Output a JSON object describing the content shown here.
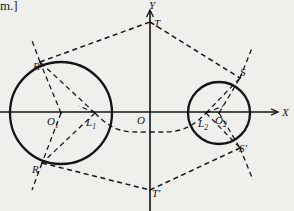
{
  "figure": {
    "cut_off_header_text": "m.]",
    "background_color": "#efefec",
    "ink_color": "#141414",
    "axes": {
      "x_label": "X",
      "y_label": "Y",
      "origin_label": "O",
      "origin_px": [
        150,
        112
      ],
      "x_axis_from": [
        0,
        112
      ],
      "x_axis_to": [
        278,
        112
      ],
      "y_axis_from": [
        150,
        10
      ],
      "y_axis_to": [
        150,
        211
      ]
    },
    "circles": [
      {
        "name": "left-circle",
        "center_label": "O",
        "center_sub": "1",
        "cx": 61,
        "cy": 113,
        "r": 51
      },
      {
        "name": "right-circle",
        "center_label": "O",
        "center_sub": "2",
        "cx": 219,
        "cy": 113,
        "r": 31
      }
    ],
    "points": [
      {
        "id": "O1",
        "label": "O",
        "sub": "1",
        "x": 61,
        "y": 113,
        "label_x": 47,
        "label_y": 125
      },
      {
        "id": "L1",
        "label": "L",
        "sub": "1",
        "x": 95,
        "y": 113,
        "label_x": 86,
        "label_y": 126
      },
      {
        "id": "O",
        "label": "O",
        "sub": "",
        "x": 150,
        "y": 112,
        "label_x": 137,
        "label_y": 124
      },
      {
        "id": "L2",
        "label": "L",
        "sub": "2",
        "x": 206,
        "y": 113,
        "label_x": 198,
        "label_y": 127
      },
      {
        "id": "O2",
        "label": "O",
        "sub": "2",
        "x": 219,
        "y": 113,
        "label_x": 215,
        "label_y": 124
      },
      {
        "id": "T",
        "label": "T",
        "sub": "",
        "x": 150,
        "y": 22,
        "label_x": 154,
        "label_y": 27
      },
      {
        "id": "Tp",
        "label": "T'",
        "sub": "",
        "x": 150,
        "y": 190,
        "label_x": 152,
        "label_y": 197
      },
      {
        "id": "R",
        "label": "R",
        "sub": "",
        "x": 40,
        "y": 62,
        "label_x": 33,
        "label_y": 70
      },
      {
        "id": "Rp",
        "label": "R'",
        "sub": "",
        "x": 42,
        "y": 163,
        "label_x": 32,
        "label_y": 173
      },
      {
        "id": "S",
        "label": "S",
        "sub": "",
        "x": 240,
        "y": 78,
        "label_x": 240,
        "label_y": 76
      },
      {
        "id": "Sp",
        "label": "S'",
        "sub": "",
        "x": 240,
        "y": 148,
        "label_x": 239,
        "label_y": 152
      }
    ],
    "tangent_lines": [
      {
        "name": "upper-tangent-R-T-S",
        "from": [
          40,
          62
        ],
        "via": [
          150,
          22
        ],
        "to": [
          240,
          78
        ]
      },
      {
        "name": "lower-tangent-Rp-Tp-Sp",
        "from": [
          42,
          163
        ],
        "via": [
          150,
          190
        ],
        "to": [
          240,
          148
        ]
      }
    ],
    "radial_dashes": [
      {
        "name": "O1-to-R",
        "from": [
          61,
          113
        ],
        "to": [
          40,
          62
        ]
      },
      {
        "name": "O1-to-Rp",
        "from": [
          61,
          113
        ],
        "to": [
          42,
          163
        ]
      },
      {
        "name": "O2-to-S",
        "from": [
          219,
          113
        ],
        "to": [
          240,
          78
        ]
      },
      {
        "name": "O2-to-Sp",
        "from": [
          219,
          113
        ],
        "to": [
          240,
          148
        ]
      },
      {
        "name": "L1-to-R",
        "from": [
          95,
          113
        ],
        "to": [
          40,
          62
        ]
      },
      {
        "name": "L1-to-Rp",
        "from": [
          95,
          113
        ],
        "to": [
          42,
          163
        ]
      },
      {
        "name": "L2-to-S",
        "from": [
          206,
          113
        ],
        "to": [
          240,
          78
        ]
      },
      {
        "name": "L2-to-Sp",
        "from": [
          206,
          113
        ],
        "to": [
          240,
          148
        ]
      }
    ],
    "extension_rays": [
      {
        "name": "R-ray-up",
        "from": [
          40,
          62
        ],
        "to": [
          31,
          38
        ]
      },
      {
        "name": "Rp-ray-down",
        "from": [
          42,
          163
        ],
        "to": [
          32,
          190
        ]
      },
      {
        "name": "S-ray-up",
        "from": [
          240,
          78
        ],
        "to": [
          252,
          48
        ]
      },
      {
        "name": "Sp-ray-down",
        "from": [
          240,
          148
        ],
        "to": [
          253,
          180
        ]
      }
    ],
    "hyperbola": {
      "name": "locus-curve-through-L1-L2",
      "description": "dashed curve passing through L1 and L2 dipping below the x-axis near the origin",
      "through": [
        [
          95,
          113
        ],
        [
          150,
          132
        ],
        [
          206,
          113
        ]
      ]
    }
  }
}
